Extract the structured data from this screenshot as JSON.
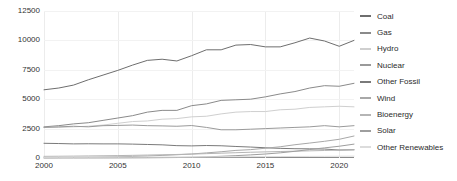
{
  "chart_data": {
    "type": "line",
    "title": "",
    "subtitle": "",
    "xlabel": "",
    "ylabel": "",
    "xlim": [
      2000,
      2021
    ],
    "ylim": [
      0,
      12500
    ],
    "grid": true,
    "legend_position": "right",
    "x": [
      2000,
      2001,
      2002,
      2003,
      2004,
      2005,
      2006,
      2007,
      2008,
      2009,
      2010,
      2011,
      2012,
      2013,
      2014,
      2015,
      2016,
      2017,
      2018,
      2019,
      2020,
      2021
    ],
    "xticks": [
      "2000",
      "2005",
      "2010",
      "2015",
      "2020"
    ],
    "xtick_values": [
      2000,
      2005,
      2010,
      2015,
      2020
    ],
    "yticks": [
      "0",
      "2500",
      "5000",
      "7500",
      "10000",
      "12500"
    ],
    "ytick_values": [
      0,
      2500,
      5000,
      7500,
      10000,
      12500
    ],
    "series": [
      {
        "name": "Coal",
        "color": "#6e6e6e",
        "values": [
          5800,
          5950,
          6200,
          6650,
          7050,
          7450,
          7900,
          8300,
          8400,
          8250,
          8700,
          9200,
          9200,
          9600,
          9650,
          9450,
          9450,
          9800,
          10200,
          9950,
          9500,
          10000
        ]
      },
      {
        "name": "Gas",
        "color": "#8a8a8a",
        "values": [
          2650,
          2750,
          2900,
          3000,
          3200,
          3400,
          3600,
          3900,
          4050,
          4050,
          4450,
          4600,
          4900,
          4950,
          5000,
          5200,
          5450,
          5650,
          5950,
          6150,
          6100,
          6350
        ]
      },
      {
        "name": "Hydro",
        "color": "#cfcfcf",
        "values": [
          2600,
          2600,
          2650,
          2700,
          2800,
          2950,
          3100,
          3150,
          3300,
          3350,
          3500,
          3550,
          3750,
          3900,
          3950,
          3950,
          4100,
          4150,
          4300,
          4350,
          4400,
          4350
        ]
      },
      {
        "name": "Nuclear",
        "color": "#9a9a9a",
        "values": [
          2600,
          2650,
          2700,
          2650,
          2750,
          2770,
          2800,
          2750,
          2730,
          2700,
          2760,
          2600,
          2400,
          2400,
          2450,
          2500,
          2550,
          2600,
          2650,
          2750,
          2650,
          2750
        ]
      },
      {
        "name": "Other Fossil",
        "color": "#7a7a7a",
        "values": [
          1250,
          1230,
          1200,
          1210,
          1200,
          1200,
          1180,
          1150,
          1120,
          1050,
          1030,
          1060,
          1040,
          980,
          930,
          870,
          820,
          790,
          780,
          760,
          680,
          700
        ]
      },
      {
        "name": "Wind",
        "color": "#a8a8a8",
        "values": [
          31,
          38,
          52,
          63,
          85,
          104,
          133,
          171,
          221,
          276,
          342,
          434,
          531,
          646,
          712,
          831,
          957,
          1128,
          1270,
          1421,
          1591,
          1870
        ]
      },
      {
        "name": "Bioenergy",
        "color": "#b5b5b5",
        "values": [
          140,
          150,
          160,
          175,
          190,
          205,
          225,
          250,
          275,
          300,
          330,
          370,
          410,
          450,
          490,
          520,
          550,
          580,
          610,
          640,
          670,
          700
        ]
      },
      {
        "name": "Solar",
        "color": "#9e9e9e",
        "values": [
          1,
          2,
          2,
          3,
          5,
          8,
          12,
          18,
          28,
          40,
          62,
          98,
          145,
          200,
          265,
          340,
          440,
          570,
          720,
          860,
          1000,
          1180
        ]
      },
      {
        "name": "Other Renewables",
        "color": "#dcdcdc",
        "values": [
          55,
          58,
          60,
          62,
          65,
          68,
          72,
          76,
          80,
          84,
          90,
          95,
          100,
          106,
          112,
          118,
          124,
          130,
          136,
          142,
          148,
          155
        ]
      }
    ]
  },
  "legend": {
    "items": [
      {
        "label": "Coal"
      },
      {
        "label": "Gas"
      },
      {
        "label": "Hydro"
      },
      {
        "label": "Nuclear"
      },
      {
        "label": "Other Fossil"
      },
      {
        "label": "Wind"
      },
      {
        "label": "Bioenergy"
      },
      {
        "label": "Solar"
      },
      {
        "label": "Other Renewables"
      }
    ]
  }
}
